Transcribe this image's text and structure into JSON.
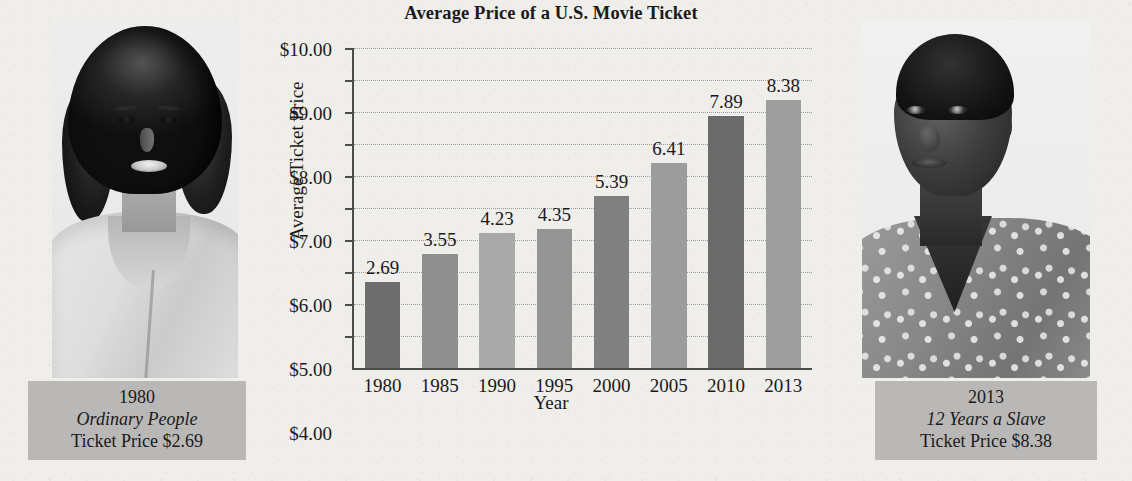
{
  "chart_data": {
    "type": "bar",
    "title": "Average Price of a U.S. Movie Ticket",
    "xlabel": "Year",
    "ylabel": "Average Ticket Price",
    "categories": [
      "1980",
      "1985",
      "1990",
      "1995",
      "2000",
      "2005",
      "2010",
      "2013"
    ],
    "values": [
      2.69,
      3.55,
      4.23,
      4.35,
      5.39,
      6.41,
      7.89,
      8.38
    ],
    "value_labels": [
      "2.69",
      "3.55",
      "4.23",
      "4.35",
      "5.39",
      "6.41",
      "7.89",
      "8.38"
    ],
    "bar_colors": [
      "#6e6e6e",
      "#8f8f8f",
      "#a9a9a9",
      "#949494",
      "#808080",
      "#9c9c9c",
      "#6b6b6b",
      "#9e9e9e"
    ],
    "ylim": [
      0,
      10
    ],
    "ytick_values": [
      1,
      2,
      3,
      4,
      5,
      6,
      7,
      8,
      9,
      10
    ],
    "ytick_labels": [
      "$1.00",
      "$2.00",
      "$3.00",
      "$4.00",
      "$5.00",
      "$6.00",
      "$7.00",
      "$8.00",
      "$9.00",
      "$10.00"
    ],
    "grid": true,
    "legend": "none"
  },
  "panels": {
    "left": {
      "photo_alt": "portrait-woman-1980",
      "year": "1980",
      "movie": "Ordinary People",
      "price_line": "Ticket Price $2.69"
    },
    "right": {
      "photo_alt": "portrait-woman-2013",
      "year": "2013",
      "movie": "12 Years a Slave",
      "price_line": "Ticket Price $8.38"
    }
  },
  "colors": {
    "page_background": "#efeeea",
    "caption_background": "#bab8b6",
    "axis": "#4b4b4b",
    "gridline": "#9a9a9a",
    "text": "#1a1a1a"
  }
}
